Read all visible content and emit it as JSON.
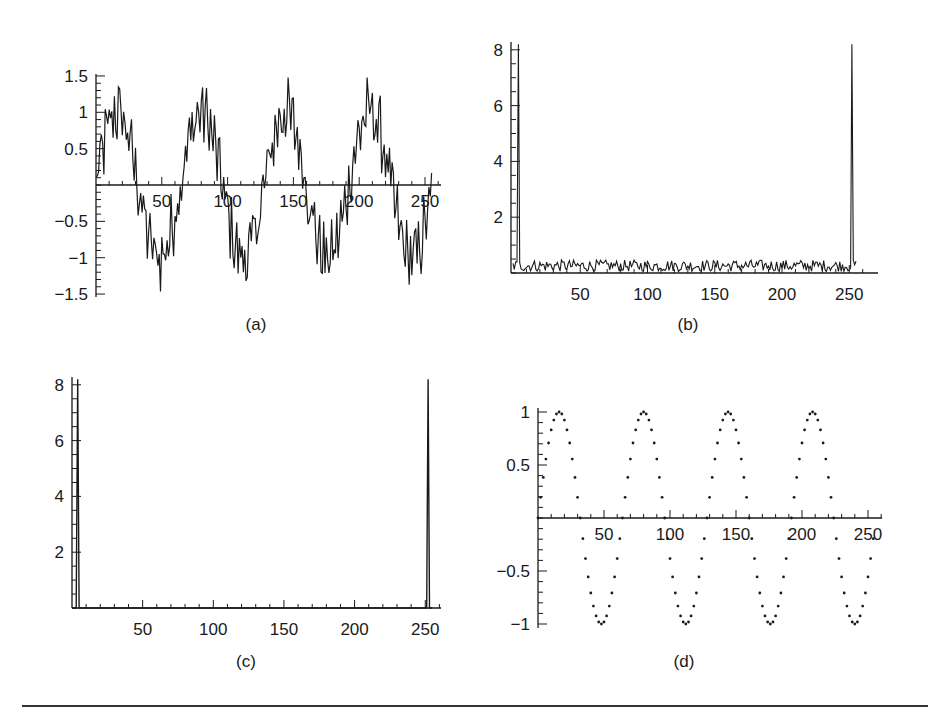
{
  "figure": {
    "captions": [
      "(a)",
      "(b)",
      "(c)",
      "(d)"
    ],
    "line_color": "#1a1a1a",
    "background": "#ffffff"
  },
  "chart_data": [
    {
      "id": "a",
      "caption": "(a)",
      "type": "line",
      "title": "",
      "description": "Noisy signal: 4-cycle sine wave (period ~64 samples) plus high-frequency noise, 256 samples",
      "xlabel": "",
      "ylabel": "",
      "xlim": [
        0,
        256
      ],
      "ylim": [
        -1.5,
        1.5
      ],
      "x_ticks": [
        50,
        100,
        150,
        200,
        250
      ],
      "y_ticks": [
        -1.5,
        -1,
        -0.5,
        0.5,
        1,
        1.5
      ],
      "x_tick_labels": [
        "50",
        "100",
        "150",
        "200",
        "250"
      ],
      "y_tick_labels": [
        "−1.5",
        "−1",
        "−0.5",
        "0.5",
        "1",
        "1.5"
      ],
      "grid": false,
      "approx_peaks": [
        {
          "x": 12,
          "y": 1.45
        },
        {
          "x": 45,
          "y": -1.4
        },
        {
          "x": 75,
          "y": 1.38
        },
        {
          "x": 110,
          "y": -1.45
        },
        {
          "x": 145,
          "y": 1.48
        },
        {
          "x": 172,
          "y": -1.35
        },
        {
          "x": 205,
          "y": 1.3
        },
        {
          "x": 240,
          "y": -1.45
        }
      ],
      "series": [
        {
          "name": "noisy signal",
          "model": "sin(2*pi*4*x/256) + noise(~0.3)",
          "n": 256
        }
      ]
    },
    {
      "id": "b",
      "caption": "(b)",
      "type": "line",
      "title": "",
      "description": "Magnitude spectrum of (a): spikes at k=4 and k=252 (~8.2), noise floor ~0.1-0.6",
      "xlabel": "",
      "ylabel": "",
      "xlim": [
        0,
        256
      ],
      "ylim": [
        0,
        8.3
      ],
      "x_ticks": [
        50,
        100,
        150,
        200,
        250
      ],
      "y_ticks": [
        2,
        4,
        6,
        8
      ],
      "x_tick_labels": [
        "50",
        "100",
        "150",
        "200",
        "250"
      ],
      "y_tick_labels": [
        "2",
        "4",
        "6",
        "8"
      ],
      "grid": false,
      "peaks": [
        {
          "x": 4,
          "y": 8.2
        },
        {
          "x": 252,
          "y": 8.2
        }
      ],
      "noise_floor": {
        "min": 0.05,
        "max": 0.65
      },
      "series": [
        {
          "name": "|FFT|",
          "n": 256
        }
      ]
    },
    {
      "id": "c",
      "caption": "(c)",
      "type": "line",
      "title": "",
      "description": "Filtered spectrum: only the spikes at k=4 and k=252 (~8.2) remain, zeros elsewhere",
      "xlabel": "",
      "ylabel": "",
      "xlim": [
        0,
        256
      ],
      "ylim": [
        0,
        8.3
      ],
      "x_ticks": [
        50,
        100,
        150,
        200,
        250
      ],
      "y_ticks": [
        2,
        4,
        6,
        8
      ],
      "x_tick_labels": [
        "50",
        "100",
        "150",
        "200",
        "250"
      ],
      "y_tick_labels": [
        "2",
        "4",
        "6",
        "8"
      ],
      "grid": false,
      "peaks": [
        {
          "x": 4,
          "y": 8.2
        },
        {
          "x": 252,
          "y": 8.2
        }
      ],
      "series": [
        {
          "name": "filtered |FFT|",
          "n": 256
        }
      ]
    },
    {
      "id": "d",
      "caption": "(d)",
      "type": "scatter",
      "title": "",
      "description": "Reconstructed clean signal: sin(2*pi*4*x/256) plotted as dots, 4 full cycles",
      "xlabel": "",
      "ylabel": "",
      "xlim": [
        0,
        256
      ],
      "ylim": [
        -1,
        1
      ],
      "x_ticks": [
        50,
        100,
        150,
        200,
        250
      ],
      "y_ticks": [
        -1,
        -0.5,
        0.5,
        1
      ],
      "x_tick_labels": [
        "50",
        "100",
        "150",
        "200",
        "250"
      ],
      "y_tick_labels": [
        "−1",
        "−0.5",
        "0.5",
        "1"
      ],
      "grid": false,
      "maxima_x": [
        16,
        80,
        144,
        208
      ],
      "minima_x": [
        48,
        112,
        176,
        240
      ],
      "zero_crossings_x": [
        0,
        32,
        64,
        96,
        128,
        160,
        192,
        224,
        256
      ],
      "series": [
        {
          "name": "reconstructed",
          "model": "sin(2*pi*4*x/256)",
          "n": 256,
          "marker": "dot",
          "step": 2
        }
      ]
    }
  ]
}
